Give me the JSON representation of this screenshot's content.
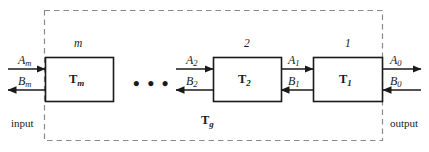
{
  "figure": {
    "colors": {
      "line": "#1a1a1a",
      "dashed_border": "#8a8a8a",
      "background": "#ffffff",
      "text": "#1a1a1a"
    },
    "group_label": "T",
    "group_label_sub": "g",
    "edge_labels": {
      "input": "input",
      "output": "output"
    },
    "ellipsis": "• • •",
    "blocks": [
      {
        "id": "block-m",
        "top_number": "m",
        "name": "T",
        "name_sub": "m",
        "in_signal": "A",
        "in_signal_sub": "m",
        "out_signal": "B",
        "out_signal_sub": "m"
      },
      {
        "id": "block-2",
        "top_number": "2",
        "name": "T",
        "name_sub": "2",
        "in_signal": "A",
        "in_signal_sub": "2",
        "out_signal": "B",
        "out_signal_sub": "2"
      },
      {
        "id": "block-1",
        "top_number": "1",
        "name": "T",
        "name_sub": "1",
        "in_signal": "A",
        "in_signal_sub": "1",
        "out_signal": "B",
        "out_signal_sub": "1"
      }
    ],
    "output_port": {
      "forward_signal": "A",
      "forward_signal_sub": "0",
      "backward_signal": "B",
      "backward_signal_sub": "0"
    }
  }
}
